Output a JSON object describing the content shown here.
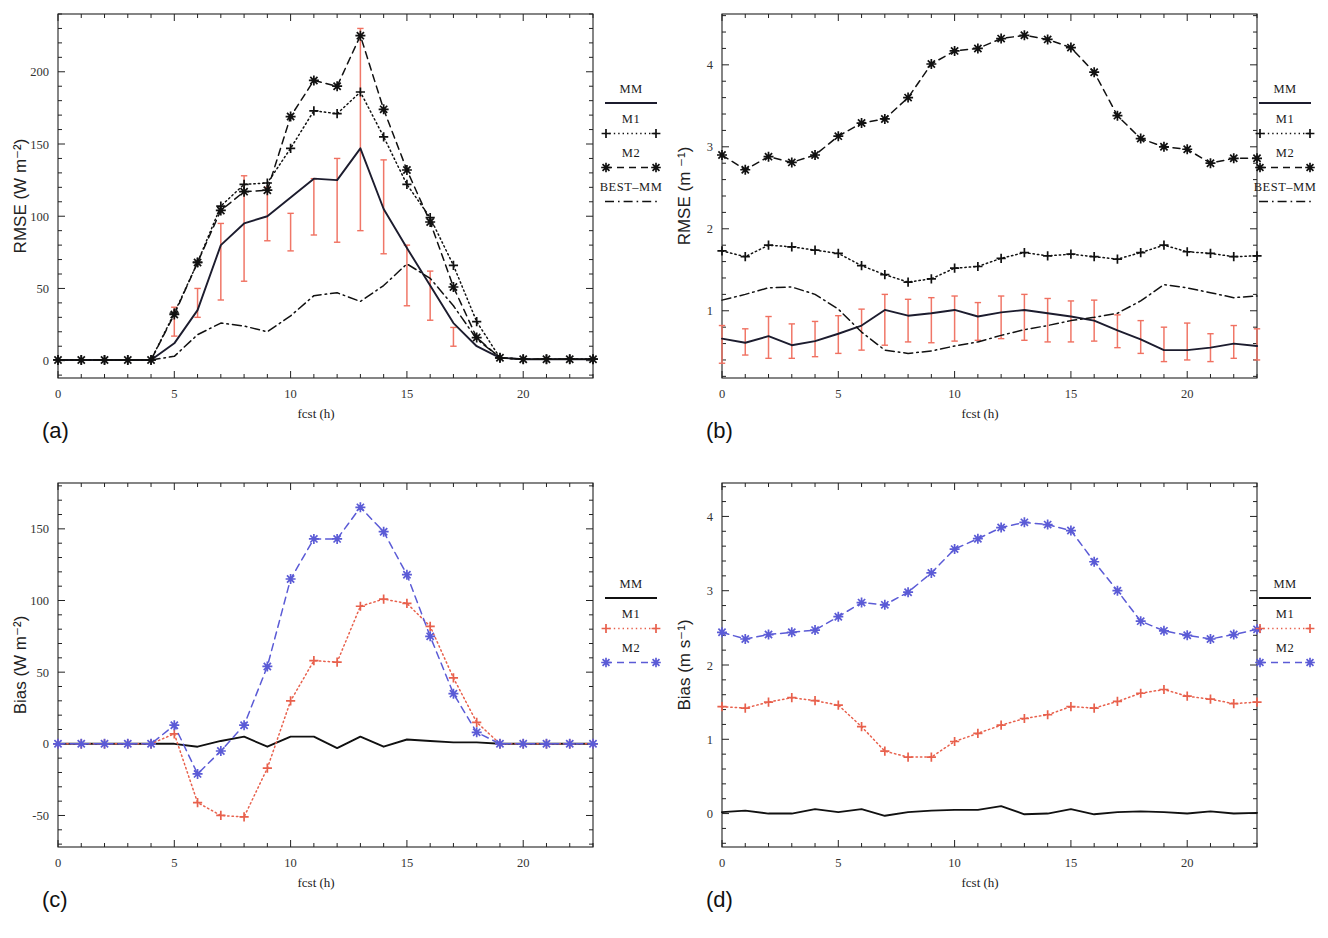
{
  "figure": {
    "panels": [
      {
        "tag": "(a)",
        "ylabel": "RMSE (W m⁻²)",
        "xlabel": "fcst  (h)",
        "legend_title": "MM",
        "legend_entries": [
          "MM",
          "M1",
          "M2",
          "BEST–MM"
        ]
      },
      {
        "tag": "(b)",
        "ylabel": "RMSE (m ⁻¹)",
        "xlabel": "fcst  (h)",
        "legend_title": "MM",
        "legend_entries": [
          "MM",
          "M1",
          "M2",
          "BEST–MM"
        ]
      },
      {
        "tag": "(c)",
        "ylabel": "Bias (W m⁻²)",
        "xlabel": "fcst  (h)",
        "legend_title": "MM",
        "legend_entries": [
          "MM",
          "M1",
          "M2"
        ]
      },
      {
        "tag": "(d)",
        "ylabel": "Bias (m s⁻¹)",
        "xlabel": "fcst  (h)",
        "legend_title": "MM",
        "legend_entries": [
          "MM",
          "M1",
          "M2"
        ]
      }
    ]
  },
  "colors": {
    "axis": "#222222",
    "mm": "#1c1c2e",
    "m1_black": "#111111",
    "m2_black": "#111111",
    "best_mm": "#111111",
    "m1_red": "#e8604c",
    "m2_blue": "#5b5bd6",
    "errorbar": "#f07060"
  },
  "chart_data": [
    {
      "panel": "a",
      "type": "line",
      "title": "",
      "xlabel": "fcst  (h)",
      "ylabel": "RMSE (W m⁻²)",
      "xlim": [
        0,
        23
      ],
      "ylim": [
        -12,
        240
      ],
      "xticks": [
        0,
        5,
        10,
        15,
        20
      ],
      "yticks": [
        0,
        50,
        100,
        150,
        200
      ],
      "grid": false,
      "legend_position": "right",
      "x": [
        0,
        1,
        2,
        3,
        4,
        5,
        6,
        7,
        8,
        9,
        10,
        11,
        12,
        13,
        14,
        15,
        16,
        17,
        18,
        19,
        20,
        21,
        22,
        23
      ],
      "series": [
        {
          "name": "MM",
          "style": "solid",
          "marker": "none",
          "color": "#1c1c2e",
          "values": [
            0.5,
            0.5,
            0.5,
            0.5,
            0.5,
            12,
            35,
            80,
            95,
            100,
            113,
            126,
            125,
            147,
            105,
            78,
            52,
            26,
            10,
            2,
            1,
            1,
            1,
            1
          ]
        },
        {
          "name": "M1",
          "style": "dotted",
          "marker": "plus",
          "color": "#111111",
          "values": [
            0.5,
            0.5,
            0.5,
            0.5,
            0.5,
            33,
            68,
            107,
            122,
            123,
            147,
            173,
            171,
            186,
            155,
            122,
            99,
            66,
            27,
            2,
            1,
            1,
            1,
            1
          ]
        },
        {
          "name": "M2",
          "style": "dashed",
          "marker": "star",
          "color": "#111111",
          "values": [
            0.5,
            0.5,
            0.5,
            0.5,
            0.5,
            32,
            68,
            104,
            117,
            118,
            169,
            194,
            190,
            225,
            174,
            132,
            96,
            51,
            16,
            2,
            1,
            1,
            1,
            1
          ]
        },
        {
          "name": "BEST–MM",
          "style": "dashdot",
          "marker": "none",
          "color": "#111111",
          "values": [
            0.5,
            0.5,
            0.5,
            0.5,
            0.5,
            3,
            18,
            26,
            24,
            20,
            31,
            45,
            47,
            41,
            52,
            67,
            57,
            38,
            15,
            2,
            1,
            1,
            1,
            1
          ]
        }
      ],
      "errorbars": {
        "color": "#f07060",
        "x": [
          5,
          6,
          7,
          8,
          9,
          10,
          11,
          12,
          13,
          14,
          15,
          16,
          17
        ],
        "lower": [
          17,
          30,
          42,
          55,
          83,
          76,
          87,
          82,
          90,
          74,
          38,
          28,
          10
        ],
        "upper": [
          37,
          50,
          95,
          128,
          120,
          102,
          126,
          140,
          230,
          139,
          80,
          62,
          23
        ]
      }
    },
    {
      "panel": "b",
      "type": "line",
      "title": "",
      "xlabel": "fcst  (h)",
      "ylabel": "RMSE (m ⁻¹)",
      "xlim": [
        0,
        23
      ],
      "ylim": [
        0.18,
        4.62
      ],
      "xticks": [
        0,
        5,
        10,
        15,
        20
      ],
      "yticks": [
        1,
        2,
        3,
        4
      ],
      "grid": false,
      "legend_position": "right",
      "x": [
        0,
        1,
        2,
        3,
        4,
        5,
        6,
        7,
        8,
        9,
        10,
        11,
        12,
        13,
        14,
        15,
        16,
        17,
        18,
        19,
        20,
        21,
        22,
        23
      ],
      "series": [
        {
          "name": "MM",
          "style": "solid",
          "marker": "none",
          "color": "#1c1c2e",
          "values": [
            0.66,
            0.61,
            0.69,
            0.58,
            0.63,
            0.72,
            0.82,
            1.01,
            0.94,
            0.97,
            1.01,
            0.93,
            0.98,
            1.01,
            0.97,
            0.93,
            0.88,
            0.76,
            0.65,
            0.52,
            0.52,
            0.55,
            0.6,
            0.57
          ]
        },
        {
          "name": "M1",
          "style": "dotted",
          "marker": "plus",
          "color": "#111111",
          "values": [
            1.73,
            1.66,
            1.8,
            1.78,
            1.74,
            1.7,
            1.55,
            1.44,
            1.35,
            1.39,
            1.52,
            1.54,
            1.64,
            1.71,
            1.67,
            1.69,
            1.66,
            1.63,
            1.71,
            1.8,
            1.72,
            1.7,
            1.66,
            1.67
          ]
        },
        {
          "name": "M2",
          "style": "dashed",
          "marker": "star",
          "color": "#111111",
          "values": [
            2.9,
            2.72,
            2.88,
            2.81,
            2.9,
            3.13,
            3.29,
            3.34,
            3.6,
            4.01,
            4.17,
            4.2,
            4.32,
            4.36,
            4.31,
            4.21,
            3.91,
            3.38,
            3.1,
            3.0,
            2.97,
            2.8,
            2.86,
            2.86
          ]
        },
        {
          "name": "BEST–MM",
          "style": "dashdot",
          "marker": "none",
          "color": "#111111",
          "values": [
            1.13,
            1.2,
            1.28,
            1.29,
            1.2,
            1.02,
            0.74,
            0.52,
            0.48,
            0.51,
            0.57,
            0.62,
            0.7,
            0.77,
            0.82,
            0.88,
            0.92,
            0.97,
            1.12,
            1.32,
            1.28,
            1.22,
            1.16,
            1.18
          ]
        }
      ],
      "errorbars": {
        "color": "#f07060",
        "x": [
          0,
          1,
          2,
          3,
          4,
          5,
          6,
          7,
          8,
          9,
          10,
          11,
          12,
          13,
          14,
          15,
          16,
          17,
          18,
          19,
          20,
          21,
          22,
          23
        ],
        "lower": [
          0.36,
          0.46,
          0.42,
          0.42,
          0.44,
          0.48,
          0.52,
          0.58,
          0.62,
          0.61,
          0.63,
          0.64,
          0.66,
          0.64,
          0.62,
          0.62,
          0.63,
          0.55,
          0.48,
          0.38,
          0.4,
          0.38,
          0.42,
          0.4
        ],
        "upper": [
          0.82,
          0.78,
          0.93,
          0.84,
          0.87,
          0.94,
          1.02,
          1.2,
          1.14,
          1.16,
          1.18,
          1.1,
          1.18,
          1.2,
          1.15,
          1.12,
          1.13,
          0.95,
          0.88,
          0.8,
          0.85,
          0.72,
          0.82,
          0.78
        ]
      }
    },
    {
      "panel": "c",
      "type": "line",
      "title": "",
      "xlabel": "fcst  (h)",
      "ylabel": "Bias (W m⁻²)",
      "xlim": [
        0,
        23
      ],
      "ylim": [
        -72,
        182
      ],
      "xticks": [
        0,
        5,
        10,
        15,
        20
      ],
      "yticks": [
        -50,
        0,
        50,
        100,
        150
      ],
      "grid": false,
      "legend_position": "right",
      "x": [
        0,
        1,
        2,
        3,
        4,
        5,
        6,
        7,
        8,
        9,
        10,
        11,
        12,
        13,
        14,
        15,
        16,
        17,
        18,
        19,
        20,
        21,
        22,
        23
      ],
      "series": [
        {
          "name": "MM",
          "style": "solid",
          "marker": "none",
          "color": "#111111",
          "values": [
            0,
            0,
            0,
            0,
            0,
            0,
            -2,
            2,
            5,
            -2,
            5,
            5,
            -3,
            5,
            -2,
            3,
            2,
            1,
            1,
            0,
            0,
            0,
            0,
            0
          ]
        },
        {
          "name": "M1",
          "style": "dotted",
          "marker": "plus",
          "color": "#e8604c",
          "values": [
            0,
            0,
            0,
            0,
            0,
            7,
            -41,
            -50,
            -51,
            -17,
            30,
            58,
            57,
            96,
            101,
            98,
            82,
            46,
            15,
            0,
            0,
            0,
            0,
            0
          ]
        },
        {
          "name": "M2",
          "style": "dashed",
          "marker": "star",
          "color": "#5b5bd6",
          "values": [
            0,
            0,
            0,
            0,
            0,
            13,
            -21,
            -5,
            13,
            54,
            115,
            143,
            143,
            165,
            148,
            118,
            75,
            35,
            8,
            0,
            0,
            0,
            0,
            0
          ]
        }
      ]
    },
    {
      "panel": "d",
      "type": "line",
      "title": "",
      "xlabel": "fcst  (h)",
      "ylabel": "Bias (m s⁻¹)",
      "xlim": [
        0,
        23
      ],
      "ylim": [
        -0.45,
        4.45
      ],
      "xticks": [
        0,
        5,
        10,
        15,
        20
      ],
      "yticks": [
        0,
        1,
        2,
        3,
        4
      ],
      "grid": false,
      "legend_position": "right",
      "x": [
        0,
        1,
        2,
        3,
        4,
        5,
        6,
        7,
        8,
        9,
        10,
        11,
        12,
        13,
        14,
        15,
        16,
        17,
        18,
        19,
        20,
        21,
        22,
        23
      ],
      "series": [
        {
          "name": "MM",
          "style": "solid",
          "marker": "none",
          "color": "#111111",
          "values": [
            0.02,
            0.04,
            0.0,
            0.0,
            0.06,
            0.02,
            0.06,
            -0.03,
            0.02,
            0.04,
            0.05,
            0.05,
            0.1,
            -0.01,
            0.0,
            0.06,
            -0.01,
            0.02,
            0.03,
            0.02,
            0.0,
            0.03,
            0.0,
            0.01
          ]
        },
        {
          "name": "M1",
          "style": "dotted",
          "marker": "plus",
          "color": "#e8604c",
          "values": [
            1.44,
            1.42,
            1.5,
            1.56,
            1.52,
            1.46,
            1.17,
            0.84,
            0.76,
            0.76,
            0.97,
            1.08,
            1.19,
            1.28,
            1.33,
            1.44,
            1.42,
            1.51,
            1.62,
            1.67,
            1.58,
            1.54,
            1.48,
            1.5
          ]
        },
        {
          "name": "M2",
          "style": "dashed",
          "marker": "star",
          "color": "#5b5bd6",
          "values": [
            2.44,
            2.35,
            2.41,
            2.44,
            2.47,
            2.65,
            2.84,
            2.81,
            2.98,
            3.24,
            3.56,
            3.7,
            3.85,
            3.92,
            3.89,
            3.81,
            3.39,
            3.0,
            2.59,
            2.46,
            2.4,
            2.35,
            2.41,
            2.48
          ]
        }
      ]
    }
  ]
}
